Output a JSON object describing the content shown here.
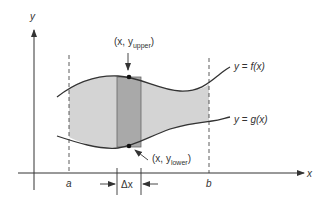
{
  "diagram": {
    "axes": {
      "x_label": "x",
      "y_label": "y"
    },
    "bounds": {
      "a_label": "a",
      "b_label": "b"
    },
    "curves": {
      "upper_label_prefix": "y = ",
      "upper_func": "f(x)",
      "lower_label_prefix": "y = ",
      "lower_func": "g(x)"
    },
    "points": {
      "upper_open": "(x, y",
      "upper_sub": "upper",
      "upper_close": ")",
      "lower_open": "(x, y",
      "lower_sub": "lower",
      "lower_close": ")"
    },
    "width_label": "Δx",
    "colors": {
      "region_fill": "#d4d4d4",
      "strip_fill": "#a9a9a9",
      "curve_stroke": "#333333"
    }
  }
}
